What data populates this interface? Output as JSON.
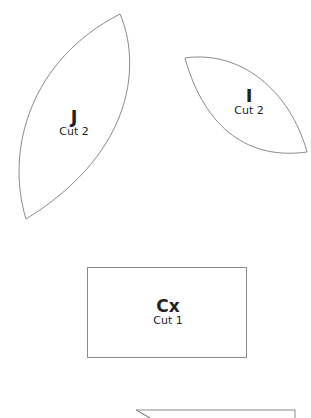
{
  "pieces": [
    {
      "id": "J",
      "letter": "J",
      "cut": "Cut 2",
      "shape": "pointed-oval"
    },
    {
      "id": "I",
      "letter": "I",
      "cut": "Cut 2",
      "shape": "pointed-oval"
    },
    {
      "id": "Cx",
      "letter": "Cx",
      "cut": "Cut 1",
      "shape": "rectangle"
    },
    {
      "id": "partial",
      "letter": "",
      "cut": "",
      "shape": "partial-outline"
    }
  ],
  "colors": {
    "outline": "#8a8a8a",
    "text": "#222222",
    "background": "#ffffff"
  }
}
